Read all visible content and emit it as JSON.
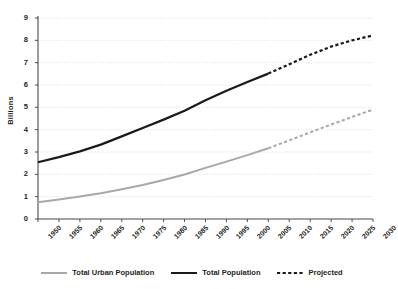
{
  "chart_data": {
    "type": "line",
    "title": "",
    "xlabel": "",
    "ylabel": "Billions",
    "xlim": [
      1950,
      2030
    ],
    "ylim": [
      0,
      9
    ],
    "ytick_step": 1,
    "xtick_step": 5,
    "grid": true,
    "grid_style": "dotted-horizontal",
    "legend_position": "bottom",
    "projection_start_year": 2005,
    "x": [
      1950,
      1955,
      1960,
      1965,
      1970,
      1975,
      1980,
      1985,
      1990,
      1995,
      2000,
      2005,
      2010,
      2015,
      2020,
      2025,
      2030
    ],
    "xtick_labels": [
      "1950",
      "1955",
      "1960",
      "1965",
      "1970",
      "1975",
      "1980",
      "1985",
      "1990",
      "1995",
      "2000",
      "2005",
      "2010",
      "2015",
      "2020",
      "2025",
      "2030"
    ],
    "ytick_labels": [
      "0",
      "1",
      "2",
      "3",
      "4",
      "5",
      "6",
      "7",
      "8",
      "9"
    ],
    "series": [
      {
        "name": "Total Population",
        "color": "#1a1a1a",
        "width": 2.2,
        "values": [
          2.54,
          2.77,
          3.03,
          3.33,
          3.7,
          4.07,
          4.45,
          4.85,
          5.32,
          5.74,
          6.13,
          6.51,
          6.93,
          7.35,
          7.72,
          8.0,
          8.22
        ],
        "solid_through": 2005
      },
      {
        "name": "Total Urban Population",
        "color": "#a8a8a8",
        "width": 2.0,
        "values": [
          0.75,
          0.87,
          1.01,
          1.15,
          1.33,
          1.52,
          1.75,
          1.99,
          2.29,
          2.57,
          2.86,
          3.17,
          3.52,
          3.88,
          4.23,
          4.57,
          4.9
        ],
        "solid_through": 2005
      }
    ],
    "legend": [
      {
        "label": "Total Urban Population",
        "color": "#a8a8a8",
        "style": "solid"
      },
      {
        "label": "Total Population",
        "color": "#1a1a1a",
        "style": "solid"
      },
      {
        "label": "Projected",
        "color": "#1a1a1a",
        "style": "dashed"
      }
    ]
  },
  "axes": {
    "axis_color": "#4d4d4d",
    "grid_color": "#d9d9d9"
  }
}
